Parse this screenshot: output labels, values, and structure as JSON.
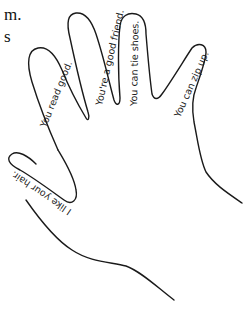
{
  "cropped_text": {
    "line1": "m.",
    "line2": "s"
  },
  "hand": {
    "fingers": [
      {
        "name": "pinky",
        "label": "You read good."
      },
      {
        "name": "ring",
        "label": "You're a good friend."
      },
      {
        "name": "middle",
        "label": "You can tie shoes."
      },
      {
        "name": "index",
        "label": "You can zip up."
      }
    ],
    "thumb": {
      "label": "I like your hair."
    },
    "stroke_color": "#1a1a1a",
    "background_color": "#ffffff"
  }
}
